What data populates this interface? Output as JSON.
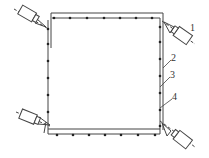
{
  "diagram": {
    "labels": [
      {
        "id": "1",
        "text": "1",
        "x": 190,
        "y": 25
      },
      {
        "id": "2",
        "text": "2",
        "x": 171,
        "y": 55
      },
      {
        "id": "3",
        "text": "3",
        "x": 170,
        "y": 72
      },
      {
        "id": "4",
        "text": "4",
        "x": 172,
        "y": 94
      }
    ],
    "colors": {
      "line": "#444444",
      "dot": "#222222",
      "background": "#ffffff"
    }
  }
}
